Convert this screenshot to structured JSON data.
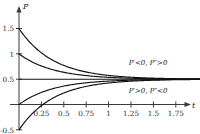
{
  "figure": {
    "title": "",
    "background_color": "#ffffff",
    "curve_color": "#111111",
    "axis_color": "#3a3a3a"
  },
  "axes": {
    "y_name": "P",
    "x_name": "t"
  },
  "annotations": {
    "above": "P′<0, P″>0",
    "below": "P′>0, P″<0"
  },
  "chart_data": {
    "type": "line",
    "title": "",
    "xlabel": "t",
    "ylabel": "P",
    "xlim": [
      0,
      1.9
    ],
    "ylim": [
      -0.6,
      1.65
    ],
    "grid": false,
    "legend": "none",
    "x_ticks": [
      0.25,
      0.5,
      0.75,
      1,
      1.25,
      1.5,
      1.75
    ],
    "x_tick_labels": [
      "0.25",
      "0.5",
      "0.75",
      "1",
      "1.25",
      "1.5",
      "1.75"
    ],
    "y_ticks": [
      1.5,
      1,
      0.5,
      -0.5
    ],
    "y_tick_labels": [
      "1.5",
      "1",
      "0.5",
      "-0.5"
    ],
    "equilibrium": 0.5,
    "decay_rate": 2.6,
    "series": [
      {
        "name": "P0 = 1.5",
        "initial_value": 1.5,
        "limit": 0.5,
        "region": "above"
      },
      {
        "name": "P0 = 1.0",
        "initial_value": 1.0,
        "limit": 0.5,
        "region": "above"
      },
      {
        "name": "P0 = 0.0",
        "initial_value": 0.0,
        "limit": 0.5,
        "region": "below"
      },
      {
        "name": "P0 = -0.5",
        "initial_value": -0.5,
        "limit": 0.5,
        "region": "below"
      },
      {
        "name": "equilibrium P = 0.5",
        "initial_value": 0.5,
        "limit": 0.5,
        "region": "equilibrium"
      }
    ],
    "annotations": [
      {
        "text": "P′<0, P″>0",
        "x": 1.35,
        "y": 0.78
      },
      {
        "text": "P′>0, P″<0",
        "x": 1.35,
        "y": 0.24
      }
    ]
  }
}
